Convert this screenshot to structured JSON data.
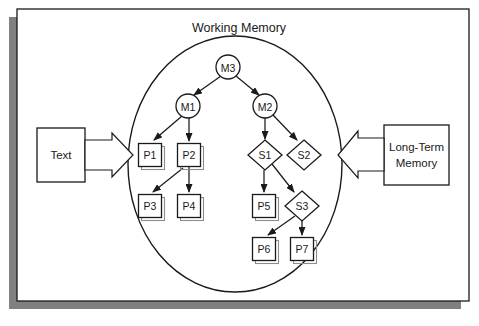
{
  "figure": {
    "title": "Working Memory",
    "frame": {
      "border_color": "#000000",
      "shadow_color": "#808080",
      "background": "#ffffff"
    },
    "container_shape": "ellipse"
  },
  "external_boxes": [
    {
      "id": "text-box",
      "label": "Text",
      "lines": [
        "Text"
      ],
      "side": "left",
      "arrow": {
        "name": "block-arrow-right",
        "direction": "right",
        "style": "hollow-block",
        "from": "Text",
        "to": "Working Memory"
      }
    },
    {
      "id": "long-term-memory-box",
      "label": "Long-Term Memory",
      "lines": [
        "Long-Term",
        "Memory"
      ],
      "side": "right",
      "arrow": {
        "name": "block-arrow-left",
        "direction": "left",
        "style": "hollow-block",
        "from": "Long-Term Memory",
        "to": "Working Memory"
      }
    }
  ],
  "nodes": [
    {
      "id": "M3",
      "label": "M3",
      "shape": "circle",
      "cx": 228,
      "cy": 67,
      "r": 12
    },
    {
      "id": "M1",
      "label": "M1",
      "shape": "circle",
      "cx": 188,
      "cy": 106,
      "r": 12
    },
    {
      "id": "M2",
      "label": "M2",
      "shape": "circle",
      "cx": 265,
      "cy": 106,
      "r": 12
    },
    {
      "id": "P1",
      "label": "P1",
      "shape": "rect",
      "cx": 150,
      "cy": 155,
      "w": 23,
      "h": 23
    },
    {
      "id": "P2",
      "label": "P2",
      "shape": "rect",
      "cx": 189,
      "cy": 155,
      "w": 23,
      "h": 23
    },
    {
      "id": "P3",
      "label": "P3",
      "shape": "rect",
      "cx": 150,
      "cy": 206,
      "w": 23,
      "h": 23
    },
    {
      "id": "P4",
      "label": "P4",
      "shape": "rect",
      "cx": 189,
      "cy": 206,
      "w": 23,
      "h": 23
    },
    {
      "id": "S1",
      "label": "S1",
      "shape": "diamond",
      "cx": 265,
      "cy": 155,
      "w": 34,
      "h": 30
    },
    {
      "id": "S2",
      "label": "S2",
      "shape": "diamond",
      "cx": 304,
      "cy": 155,
      "w": 34,
      "h": 30
    },
    {
      "id": "P5",
      "label": "P5",
      "shape": "rect",
      "cx": 264,
      "cy": 206,
      "w": 23,
      "h": 23
    },
    {
      "id": "S3",
      "label": "S3",
      "shape": "diamond",
      "cx": 302,
      "cy": 206,
      "w": 34,
      "h": 30
    },
    {
      "id": "P6",
      "label": "P6",
      "shape": "rect",
      "cx": 264,
      "cy": 249,
      "w": 23,
      "h": 23
    },
    {
      "id": "P7",
      "label": "P7",
      "shape": "rect",
      "cx": 302,
      "cy": 249,
      "w": 23,
      "h": 23
    }
  ],
  "edges": [
    {
      "from": "M3",
      "to": "M1"
    },
    {
      "from": "M3",
      "to": "M2"
    },
    {
      "from": "M1",
      "to": "P1"
    },
    {
      "from": "M1",
      "to": "P2"
    },
    {
      "from": "P2",
      "to": "P3"
    },
    {
      "from": "P2",
      "to": "P4"
    },
    {
      "from": "M2",
      "to": "S1"
    },
    {
      "from": "M2",
      "to": "S2"
    },
    {
      "from": "S1",
      "to": "P5"
    },
    {
      "from": "S1",
      "to": "S3"
    },
    {
      "from": "S3",
      "to": "P6"
    },
    {
      "from": "S3",
      "to": "P7"
    }
  ],
  "colors": {
    "stroke": "#1a1a1a",
    "text": "#1a1a1a",
    "shadow": "#808080",
    "node_shadow": "#8c8c8c",
    "background": "#ffffff"
  }
}
